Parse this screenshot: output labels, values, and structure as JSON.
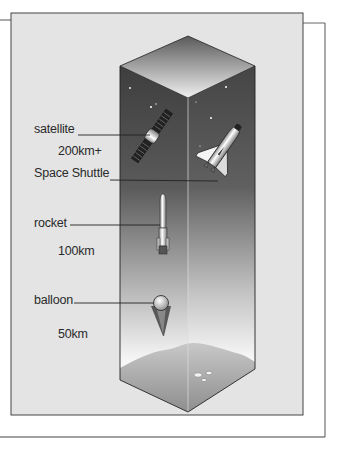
{
  "diagram": {
    "labels": [
      {
        "name": "satellite",
        "text": "satellite",
        "altitude": "200km+"
      },
      {
        "name": "space-shuttle",
        "text": "Space Shuttle"
      },
      {
        "name": "rocket",
        "text": "rocket",
        "altitude": "100km"
      },
      {
        "name": "balloon",
        "text": "balloon",
        "altitude": "50km"
      }
    ],
    "colors": {
      "panel": "#e4e4e4",
      "frame_line": "#555555",
      "space_top": "#4a4a4a",
      "sky_bottom": "#f4f4f4",
      "ground": "#bdbdbd"
    }
  }
}
